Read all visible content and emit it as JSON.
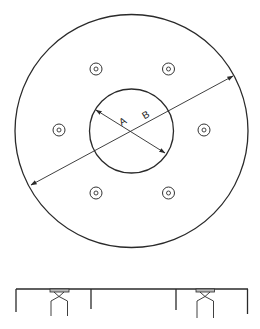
{
  "figure": {
    "type": "technical-drawing",
    "plan_view": {
      "outer_circle": true,
      "inner_circle": true,
      "bolt_holes": {
        "count": 6,
        "style": "concentric double circle"
      },
      "dimensions": [
        {
          "label": "A",
          "measures": "inner circle diameter",
          "arrows": "both ends"
        },
        {
          "label": "B",
          "measures": "outer circle diameter",
          "arrows": "both ends"
        }
      ]
    },
    "side_view": {
      "supports": 2,
      "description": "horizontal deck with two bracket supports and vertical edges"
    }
  },
  "labels": {
    "dim_a": "A",
    "dim_b": "B"
  },
  "colors": {
    "line": "#2a2a2a",
    "background": "#ffffff",
    "plate_fill": "#bdbdbd"
  }
}
